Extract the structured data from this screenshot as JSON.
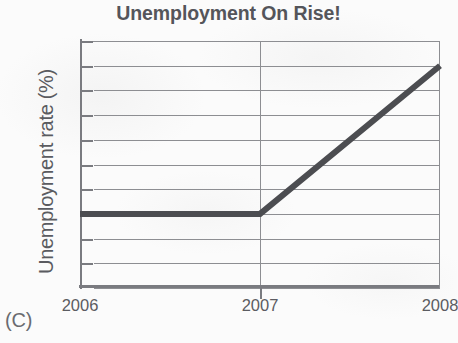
{
  "figure": {
    "caption": "(C)"
  },
  "chart_data": {
    "type": "line",
    "title": "Unemployment On Rise!",
    "xlabel": "",
    "ylabel": "Unemployment rate (%)",
    "x": [
      2006,
      2007,
      2008
    ],
    "values": [
      4.6,
      4.6,
      5.8
    ],
    "series": [
      {
        "name": "Unemployment rate",
        "values": [
          4.6,
          4.6,
          5.8
        ]
      }
    ],
    "xlim": [
      2006,
      2008
    ],
    "ylim": [
      4,
      6
    ],
    "x_tick_labels": [
      "2006",
      "2007",
      "2008"
    ],
    "y_tick_labels": [
      "6",
      "5.8",
      "5.6",
      "5.4",
      "5.2",
      "5",
      "4.8",
      "4.6",
      "4.4",
      "4.2",
      "4"
    ],
    "y_tick_values": [
      6,
      5.8,
      5.6,
      5.4,
      5.2,
      5,
      4.8,
      4.6,
      4.4,
      4.2,
      4
    ],
    "grid": "horizontal gridlines at every y tick; vertical gridline at 2007",
    "legend": "none",
    "line_color": "#4c4d51",
    "grid_color": "#8d8e92",
    "axis_color": "#7a7b80",
    "text_color": "#55565a",
    "background_color": "#fbfbfb",
    "annotations": []
  }
}
